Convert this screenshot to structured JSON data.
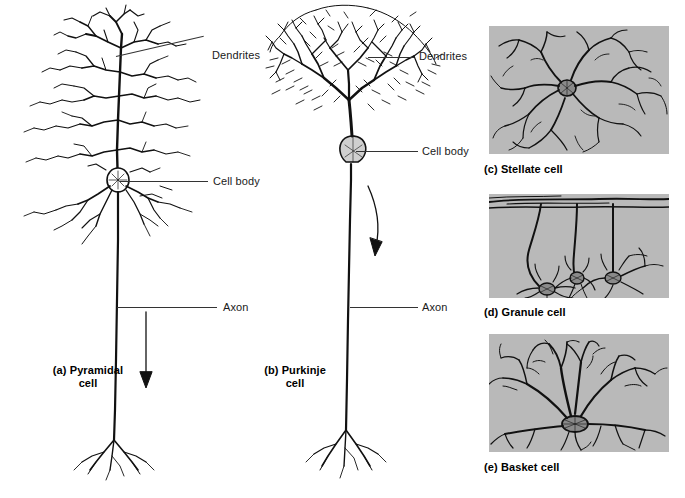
{
  "figure": {
    "background_color": "#ffffff",
    "panel_background_color": "#b9b9b9",
    "ink_color": "#111111"
  },
  "panels": [
    {
      "key": "pyramidal",
      "caption_line1": "(a) Pyramidal",
      "caption_line2": "cell",
      "labels": [
        {
          "name": "dendrites",
          "text": "Dendrites"
        },
        {
          "name": "cell-body",
          "text": "Cell body"
        },
        {
          "name": "axon",
          "text": "Axon"
        }
      ]
    },
    {
      "key": "purkinje",
      "caption_line1": "(b) Purkinje",
      "caption_line2": "cell",
      "labels": [
        {
          "name": "dendrites",
          "text": "Dendrites"
        },
        {
          "name": "cell-body",
          "text": "Cell body"
        },
        {
          "name": "axon",
          "text": "Axon"
        }
      ]
    },
    {
      "key": "stellate",
      "caption": "(c) Stellate cell"
    },
    {
      "key": "granule",
      "caption": "(d) Granule cell"
    },
    {
      "key": "basket",
      "caption": "(e) Basket cell"
    }
  ],
  "captions": {
    "pyramidal_l1": "(a) Pyramidal",
    "pyramidal_l2": "cell",
    "purkinje_l1": "(b) Purkinje",
    "purkinje_l2": "cell",
    "stellate": "(c) Stellate cell",
    "granule": "(d) Granule cell",
    "basket": "(e) Basket cell"
  },
  "annotations": {
    "pyr_dendrites": "Dendrites",
    "pyr_cell_body": "Cell body",
    "pyr_axon": "Axon",
    "pur_dendrites": "Dendrites",
    "pur_cell_body": "Cell body",
    "pur_axon": "Axon"
  }
}
